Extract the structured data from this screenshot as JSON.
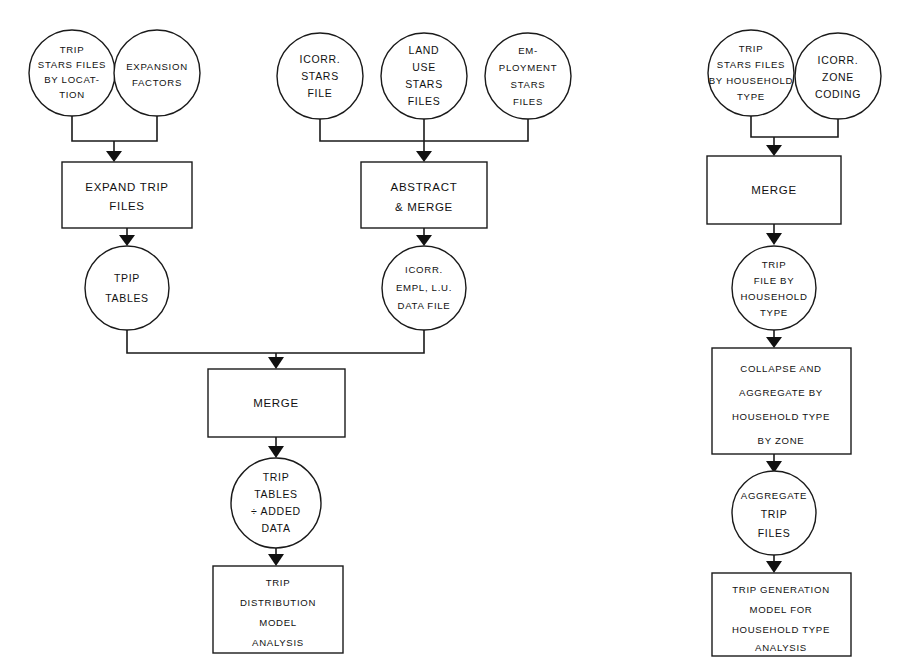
{
  "diagram": {
    "background_color": "#ffffff",
    "line_color": "#1a1a1a",
    "text_color": "#111111",
    "groups": [
      {
        "id": "left",
        "name": "Trip Expansion Branch"
      },
      {
        "id": "middle",
        "name": "Abstract and Merge Branch"
      },
      {
        "id": "right",
        "name": "Household Type Branch"
      }
    ]
  },
  "nodes": {
    "trip_stars_by_location": {
      "shape": "circle",
      "lines": [
        "TRIP",
        "STARS FILES",
        "BY LOCAT-",
        "TION"
      ]
    },
    "expansion_factors": {
      "shape": "circle",
      "lines": [
        "EXPANSION",
        "FACTORS"
      ]
    },
    "expand_trip_files": {
      "shape": "rectangle",
      "lines": [
        "EXPAND TRIP",
        "FILES"
      ]
    },
    "tpip_tables": {
      "shape": "circle",
      "lines": [
        "TPIP",
        "TABLES"
      ]
    },
    "icorr_stars_file": {
      "shape": "circle",
      "lines": [
        "ICORR.",
        "STARS",
        "FILE"
      ]
    },
    "land_use_stars_files": {
      "shape": "circle",
      "lines": [
        "LAND",
        "USE",
        "STARS",
        "FILES"
      ]
    },
    "employment_stars_files": {
      "shape": "circle",
      "lines": [
        "EM-",
        "PLOYMENT",
        "STARS",
        "FILES"
      ]
    },
    "abstract_and_merge": {
      "shape": "rectangle",
      "lines": [
        "ABSTRACT",
        "& MERGE"
      ]
    },
    "icorr_empl_lu_data_file": {
      "shape": "circle",
      "lines": [
        "ICORR.",
        "EMPL, L.U.",
        "DATA FILE"
      ]
    },
    "merge_center": {
      "shape": "rectangle",
      "lines": [
        "MERGE"
      ]
    },
    "trip_tables_added_data": {
      "shape": "circle",
      "lines": [
        "TRIP",
        "TABLES",
        "÷ ADDED",
        "DATA"
      ]
    },
    "trip_distribution_model": {
      "shape": "rectangle",
      "lines": [
        "TRIP",
        "DISTRIBUTION",
        "MODEL",
        "ANALYSIS"
      ]
    },
    "trip_stars_by_household_type": {
      "shape": "circle",
      "lines": [
        "TRIP",
        "STARS FILES",
        "BY HOUSEHOLD",
        "TYPE"
      ]
    },
    "icorr_zone_coding": {
      "shape": "circle",
      "lines": [
        "ICORR.",
        "ZONE",
        "CODING"
      ]
    },
    "merge_right": {
      "shape": "rectangle",
      "lines": [
        "MERGE"
      ]
    },
    "trip_file_by_household_type": {
      "shape": "circle",
      "lines": [
        "TRIP",
        "FILE BY",
        "HOUSEHOLD",
        "TYPE"
      ]
    },
    "collapse_and_aggregate": {
      "shape": "rectangle",
      "lines": [
        "COLLAPSE AND",
        "AGGREGATE BY",
        "HOUSEHOLD TYPE",
        "BY ZONE"
      ]
    },
    "aggregate_trip_files": {
      "shape": "circle",
      "lines": [
        "AGGREGATE",
        "TRIP",
        "FILES"
      ]
    },
    "trip_generation_model": {
      "shape": "rectangle",
      "lines": [
        "TRIP GENERATION",
        "MODEL FOR",
        "HOUSEHOLD TYPE",
        "ANALYSIS"
      ]
    }
  }
}
